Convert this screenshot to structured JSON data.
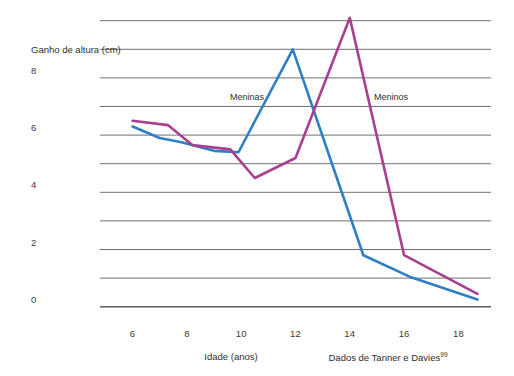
{
  "chart_data": {
    "type": "line",
    "title": "",
    "xlabel": "Idade (anos)",
    "ylabel": "Ganho de altura (cm)",
    "source_note": "Dados de Tanner e Davies",
    "source_note_superscript": "99",
    "xlim": [
      4.8,
      19.2
    ],
    "ylim": [
      0,
      10
    ],
    "xticks": [
      6,
      8,
      10,
      12,
      14,
      16,
      18
    ],
    "xtick_labels": [
      "6",
      "8",
      "10",
      "12",
      "14",
      "16",
      "18"
    ],
    "yticks": [
      0,
      2,
      4,
      6,
      8
    ],
    "ytick_labels": [
      "0",
      "2",
      "4",
      "6",
      "8"
    ],
    "gridlines_major_y": [
      0,
      1,
      2,
      3,
      4,
      5,
      6,
      7,
      8,
      9,
      10
    ],
    "grid": true,
    "legend_position": "inline-annotation",
    "series": [
      {
        "name": "Meninas",
        "color": "#2e7fc4",
        "x": [
          6.0,
          7.0,
          7.8,
          9.0,
          9.9,
          11.9,
          14.5,
          16.2,
          18.7
        ],
        "values": [
          6.3,
          5.9,
          5.75,
          5.45,
          5.4,
          9.0,
          1.8,
          1.05,
          0.25
        ]
      },
      {
        "name": "Meninos",
        "color": "#a93f8f",
        "x": [
          6.0,
          7.3,
          8.2,
          9.6,
          10.5,
          12.0,
          14.0,
          16.0,
          18.7
        ],
        "values": [
          6.5,
          6.35,
          5.65,
          5.5,
          4.5,
          5.2,
          10.1,
          1.8,
          0.45
        ]
      }
    ]
  },
  "axes": {
    "y_title": "Ganho de altura (cm)",
    "x_title": "Idade (anos)"
  },
  "annotations": {
    "meninas_label": "Meninas",
    "meninos_label": "Meninos",
    "source_text": "Dados de Tanner e Davies",
    "source_ref": "99"
  },
  "colors": {
    "girls_line": "#2e7fc4",
    "boys_line": "#a93f8f",
    "gridline": "#6f7073",
    "baseline": "#5a5b5e",
    "text": "#2e2e2e",
    "background": "#ffffff"
  }
}
